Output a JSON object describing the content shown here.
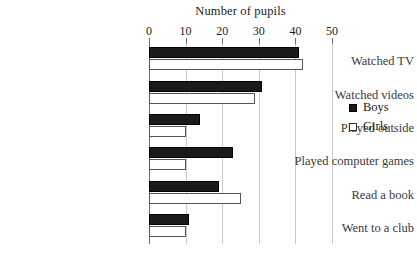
{
  "chart_data": {
    "type": "bar",
    "orientation": "horizontal",
    "title": "Number of pupils",
    "xlabel": "",
    "ylabel": "",
    "xlim": [
      0,
      50
    ],
    "xticks": [
      0,
      10,
      20,
      30,
      40,
      50
    ],
    "xtick_labels": [
      "0",
      "10",
      "20",
      "30",
      "40",
      "50"
    ],
    "grid": true,
    "grid_axis": "x",
    "legend_position": "right",
    "categories": [
      "Watched TV",
      "Watched videos",
      "Played outside",
      "Played computer games",
      "Read a book",
      "Went to a club"
    ],
    "series": [
      {
        "name": "Boys",
        "color": "#1a1a1a",
        "values": [
          41,
          31,
          14,
          23,
          19,
          11
        ]
      },
      {
        "name": "Girls",
        "color": "#ffffff",
        "values": [
          42,
          29,
          10,
          10,
          25,
          10
        ]
      }
    ]
  },
  "legend": {
    "items": [
      {
        "label": "Boys",
        "swatch": "filled-black-square"
      },
      {
        "label": "Girls",
        "swatch": "outlined-white-square"
      }
    ]
  },
  "colors": {
    "boys_fill": "#1a1a1a",
    "girls_fill": "#ffffff",
    "girls_stroke": "#555555",
    "gridline": "#c9c9c9",
    "axis": "#6f6f6f",
    "text": "#1d1d1d",
    "background": "#ffffff"
  }
}
